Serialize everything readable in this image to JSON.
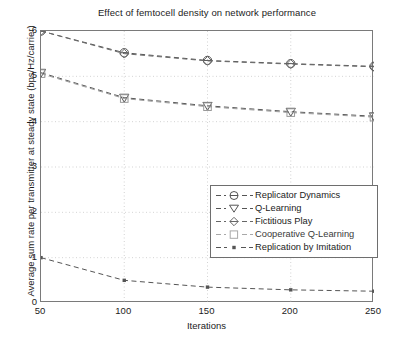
{
  "chart_data": {
    "type": "line",
    "title": "Effect of femtocell density on network performance",
    "xlabel": "Iterations",
    "ylabel": "Average sum rate per transmitter at steady state (bps/Hz/carrier)",
    "x": [
      50,
      100,
      150,
      200,
      250
    ],
    "xlim": [
      50,
      250
    ],
    "ylim": [
      0,
      6
    ],
    "xticks": [
      "50",
      "100",
      "150",
      "200",
      "250"
    ],
    "yticks": [
      "0",
      "1",
      "2",
      "3",
      "4",
      "5",
      "6"
    ],
    "grid": "dotted both axes",
    "legend_position": "center-right",
    "series": [
      {
        "name": "Replicator Dynamics",
        "marker": "circle",
        "linestyle": "dashed",
        "color": "#555555",
        "values": [
          6.0,
          5.52,
          5.35,
          5.28,
          5.22
        ]
      },
      {
        "name": "Q-Learning",
        "marker": "triangle-down",
        "linestyle": "dashed",
        "color": "#555555",
        "values": [
          5.08,
          4.53,
          4.35,
          4.22,
          4.12
        ]
      },
      {
        "name": "Fictitious Play",
        "marker": "diamond",
        "linestyle": "dashed",
        "color": "#6a6a6a",
        "values": [
          6.0,
          5.5,
          5.34,
          5.27,
          5.21
        ]
      },
      {
        "name": "Cooperative Q-Learning",
        "marker": "square",
        "linestyle": "dashed",
        "color": "#9a9a9a",
        "values": [
          5.06,
          4.51,
          4.33,
          4.2,
          4.1
        ]
      },
      {
        "name": "Replication by Imitation",
        "marker": "dot",
        "linestyle": "dashed",
        "color": "#555555",
        "values": [
          1.0,
          0.5,
          0.35,
          0.29,
          0.26
        ]
      }
    ]
  },
  "legend": {
    "items": [
      {
        "label": "Replicator Dynamics"
      },
      {
        "label": "Q-Learning"
      },
      {
        "label": "Fictitious Play"
      },
      {
        "label": "Cooperative Q-Learning"
      },
      {
        "label": "Replication by Imitation"
      }
    ]
  },
  "axes": {
    "x_label": "Iterations",
    "y_label": "Average sum rate per transmitter at steady state (bps/Hz/carrier)",
    "x_ticks": [
      "50",
      "100",
      "150",
      "200",
      "250"
    ],
    "y_ticks": [
      "6",
      "5",
      "4",
      "3",
      "2",
      "1",
      "0"
    ]
  },
  "colors": {
    "axis": "#7a7a7a",
    "grid": "#c8c8c8",
    "text": "#1b1b1b",
    "line_dark": "#555555",
    "line_mid": "#6a6a6a",
    "line_light": "#9a9a9a",
    "background": "#ffffff"
  }
}
